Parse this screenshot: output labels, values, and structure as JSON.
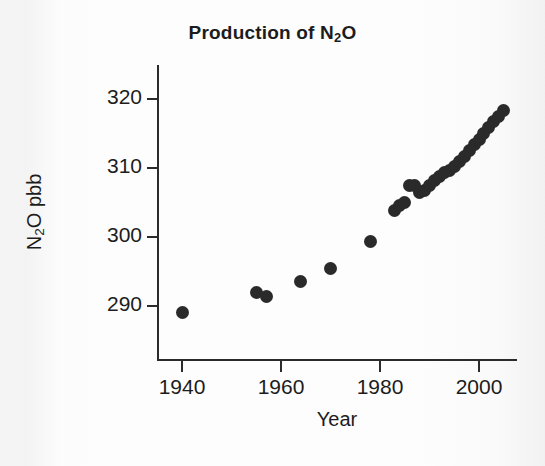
{
  "chart_data": {
    "type": "scatter",
    "title": "Production of N2O",
    "title_parts": {
      "pre": "Production of N",
      "sub": "2",
      "post": "O"
    },
    "xlabel": "Year",
    "ylabel": "N2O pbb",
    "ylabel_parts": {
      "pre": "N",
      "sub": "2",
      "post": "O pbb"
    },
    "xlim": [
      1933,
      2006
    ],
    "ylim": [
      284,
      322
    ],
    "grid": false,
    "legend": null,
    "marker": "filled-circle",
    "marker_color": "#2a2a2a",
    "xticks": [
      1940,
      1960,
      1980,
      2000
    ],
    "xtick_labels": [
      "1940",
      "1960",
      "1980",
      "2000"
    ],
    "yticks": [
      290,
      300,
      310,
      320
    ],
    "ytick_labels": [
      "290",
      "300",
      "310",
      "320"
    ],
    "x": [
      1940,
      1955,
      1957,
      1964,
      1970,
      1978,
      1983,
      1984,
      1985,
      1986,
      1987,
      1988,
      1989,
      1990,
      1991,
      1992,
      1993,
      1994,
      1995,
      1996,
      1997,
      1998,
      1999,
      2000,
      2001,
      2002,
      2003,
      2004
    ],
    "values": [
      289.0,
      292.0,
      291.4,
      293.6,
      295.5,
      299.4,
      303.8,
      304.6,
      305.0,
      307.5,
      307.4,
      306.4,
      306.8,
      307.4,
      308.2,
      308.8,
      309.4,
      309.7,
      310.2,
      310.9,
      311.6,
      312.5,
      313.4,
      314.1,
      315.0,
      315.9,
      316.7,
      317.4
    ],
    "points": [
      {
        "year": 1940,
        "value": 289.0
      },
      {
        "year": 1955,
        "value": 292.0
      },
      {
        "year": 1957,
        "value": 291.4
      },
      {
        "year": 1964,
        "value": 293.6
      },
      {
        "year": 1970,
        "value": 295.5
      },
      {
        "year": 1978,
        "value": 299.4
      },
      {
        "year": 1983,
        "value": 303.8
      },
      {
        "year": 1984,
        "value": 304.6
      },
      {
        "year": 1985,
        "value": 305.0
      },
      {
        "year": 1986,
        "value": 307.5
      },
      {
        "year": 1987,
        "value": 307.4
      },
      {
        "year": 1988,
        "value": 306.4
      },
      {
        "year": 1989,
        "value": 306.8
      },
      {
        "year": 1990,
        "value": 307.4
      },
      {
        "year": 1991,
        "value": 308.2
      },
      {
        "year": 1992,
        "value": 308.8
      },
      {
        "year": 1993,
        "value": 309.4
      },
      {
        "year": 1994,
        "value": 309.7
      },
      {
        "year": 1995,
        "value": 310.2
      },
      {
        "year": 1996,
        "value": 310.9
      },
      {
        "year": 1997,
        "value": 311.6
      },
      {
        "year": 1998,
        "value": 312.5
      },
      {
        "year": 1999,
        "value": 313.4
      },
      {
        "year": 2000,
        "value": 314.1
      },
      {
        "year": 2001,
        "value": 315.0
      },
      {
        "year": 2002,
        "value": 315.9
      },
      {
        "year": 2003,
        "value": 316.7
      },
      {
        "year": 2004,
        "value": 317.4
      },
      {
        "year": 2005,
        "value": 318.4
      }
    ]
  },
  "colors": {
    "marker": "#2a2a2a",
    "axis": "#2b2b2b",
    "text": "#1c1c1c",
    "background": "#ffffff"
  }
}
